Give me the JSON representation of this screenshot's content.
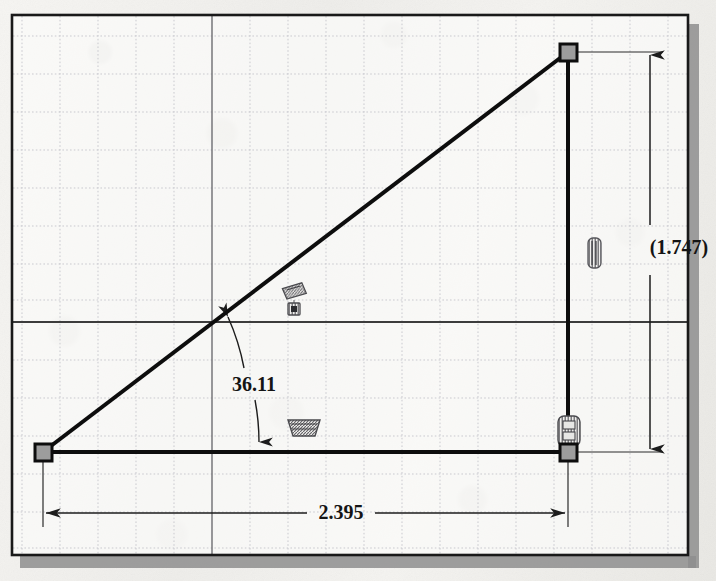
{
  "app": {
    "kind": "cad-sketch",
    "title": "Right triangle sketch"
  },
  "canvas": {
    "width": 716,
    "height": 581,
    "paper_color": "#f1f0ed",
    "frame_color": "#1a1a1a",
    "shadow_color": "#8b8b8b",
    "grid_color": "#c9c9cf",
    "axis_color": "#4a4a4a",
    "geometry_color": "#121212",
    "dimension_color": "#2a2a2a",
    "point_fill": "#9a9a9a",
    "point_stroke": "#101010",
    "constraint_color": "#6e6e72"
  },
  "grid": {
    "spacing": 38,
    "origin_x": 212,
    "origin_y": 322,
    "style": "dotted"
  },
  "sketch": {
    "vertices": [
      {
        "name": "origin-vertex",
        "label": "bottom-left",
        "x": 43,
        "y": 452
      },
      {
        "name": "bottom-right-vertex",
        "label": "bottom-right",
        "x": 568,
        "y": 452
      },
      {
        "name": "apex-vertex",
        "label": "top-right",
        "x": 568,
        "y": 52
      }
    ],
    "segments": [
      {
        "name": "horizontal-segment",
        "label": "base",
        "x1": 43,
        "y1": 452,
        "x2": 568,
        "y2": 452
      },
      {
        "name": "vertical-segment",
        "label": "height",
        "x1": 568,
        "y1": 452,
        "x2": 568,
        "y2": 52
      },
      {
        "name": "diagonal-segment",
        "label": "hypotenuse",
        "x1": 43,
        "y1": 452,
        "x2": 568,
        "y2": 52
      }
    ]
  },
  "dimensions": {
    "angle": {
      "value": "36.11",
      "type": "angular",
      "driven": false,
      "text_x": 253,
      "text_y": 390
    },
    "horizontal": {
      "value": "2.395",
      "type": "linear-horizontal",
      "driven": false,
      "text_x": 340,
      "text_y": 518,
      "line_y": 513
    },
    "vertical": {
      "value": "(1.747)",
      "type": "linear-vertical",
      "driven": true,
      "text_x": 678,
      "text_y": 247,
      "line_x": 650
    }
  },
  "constraints": [
    {
      "name": "constraint-coincident-diagonal",
      "icon": "coincident-icon",
      "x": 294,
      "y": 294,
      "kind": "coincident"
    },
    {
      "name": "constraint-horizontal-base",
      "icon": "horizontal-icon",
      "x": 303,
      "y": 428,
      "kind": "horizontal"
    },
    {
      "name": "constraint-vertical-right",
      "icon": "vertical-icon",
      "x": 568,
      "y": 432,
      "kind": "vertical"
    },
    {
      "name": "constraint-vertical-dim",
      "icon": "vertical-icon",
      "x": 594,
      "y": 252,
      "kind": "vertical"
    }
  ]
}
